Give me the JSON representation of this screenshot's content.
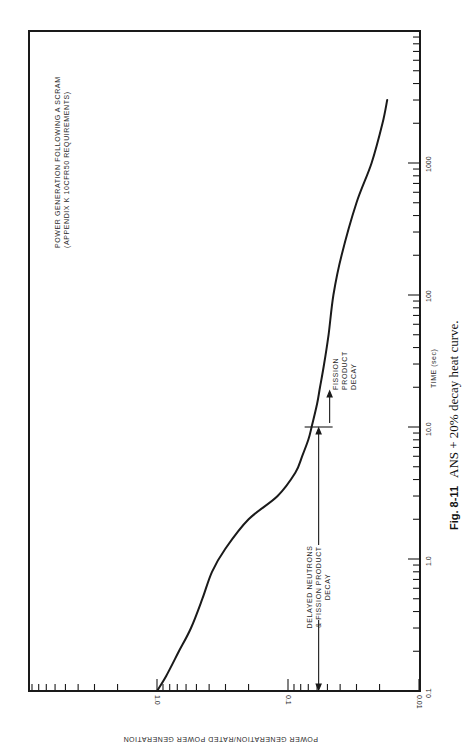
{
  "figure": {
    "caption_number": "Fig. 8-11",
    "caption_text": "ANS + 20% decay heat curve."
  },
  "annotations": {
    "title_line1": "POWER GENERATION FOLLOWING A SCRAM",
    "title_line2": "(APPENDIX K 10CFR50 REQUIREMENTS)",
    "delayed_line1": "DELAYED NEUTRONS",
    "delayed_line2": "& FISSION PRODUCT",
    "delayed_line3": "DECAY",
    "fission_line1": "FISSION",
    "fission_line2": "PRODUCT",
    "fission_line3": "DECAY"
  },
  "axes": {
    "x_title": "TIME (sec)",
    "y_title": "POWER GENERATION/RATED POWER GENERATION",
    "x_ticks": [
      "0.1",
      "1.0",
      "10.0",
      "100",
      "1000"
    ],
    "y_ticks": [
      "1.0",
      "0.1",
      "0.01"
    ]
  },
  "chart_data": {
    "type": "line",
    "title": "POWER GENERATION FOLLOWING A SCRAM (APPENDIX K 10CFR50 REQUIREMENTS)",
    "caption": "Fig. 8-11 ANS + 20% decay heat curve.",
    "xlabel": "TIME (sec)",
    "ylabel": "POWER GENERATION/RATED POWER GENERATION",
    "xscale": "log",
    "yscale": "log",
    "xlim": [
      0.1,
      10000
    ],
    "ylim": [
      0.01,
      10
    ],
    "x_tick_labels": [
      "0.1",
      "1.0",
      "10.0",
      "100",
      "1000"
    ],
    "y_tick_labels": [
      "0.01",
      "0.1",
      "1.0"
    ],
    "grid": false,
    "orientation": "rotated 90 degrees counter-clockwise on page",
    "series": [
      {
        "name": "ANS + 20% decay heat",
        "x": [
          0.1,
          0.13,
          0.2,
          0.3,
          0.5,
          0.8,
          1.2,
          2.0,
          3.0,
          4.5,
          6.0,
          8.0,
          10,
          15,
          20,
          30,
          50,
          100,
          200,
          500,
          1000,
          2000,
          3000
        ],
        "y": [
          1.0,
          0.85,
          0.68,
          0.55,
          0.45,
          0.38,
          0.3,
          0.2,
          0.12,
          0.088,
          0.078,
          0.07,
          0.066,
          0.06,
          0.057,
          0.053,
          0.049,
          0.045,
          0.039,
          0.03,
          0.023,
          0.019,
          0.0175
        ]
      }
    ],
    "annotations": [
      {
        "text": "DELAYED NEUTRONS & FISSION PRODUCT DECAY",
        "x_range": [
          0.1,
          10
        ],
        "arrow": "double"
      },
      {
        "text": "FISSION PRODUCT DECAY",
        "x_from": 10,
        "arrow": "toward increasing time"
      }
    ],
    "marker": {
      "x": 10,
      "y": 0.066,
      "note": "transition marker at 10 s"
    }
  },
  "layout": {
    "plot": {
      "left": 29,
      "top": 31,
      "right": 420,
      "bottom": 691
    },
    "x_px_per_decade": 132,
    "x_origin_px_at_t1": 559,
    "y_px_per_decade": 131,
    "y_origin_px_at_p1": 157,
    "line_color": "#1a1a1a"
  }
}
